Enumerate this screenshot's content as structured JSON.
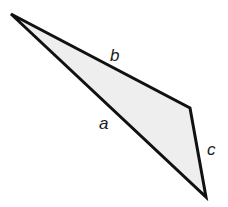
{
  "diagram": {
    "type": "triangle",
    "fill_color": "#eeeeee",
    "stroke_color": "#111111",
    "vertices": [
      {
        "x": 11,
        "y": 14
      },
      {
        "x": 190,
        "y": 108
      },
      {
        "x": 206,
        "y": 197
      }
    ],
    "sides": [
      {
        "label": "a",
        "between": "top-left vertex and bottom vertex"
      },
      {
        "label": "b",
        "between": "top-left vertex and right vertex"
      },
      {
        "label": "c",
        "between": "right vertex and bottom vertex"
      }
    ]
  }
}
